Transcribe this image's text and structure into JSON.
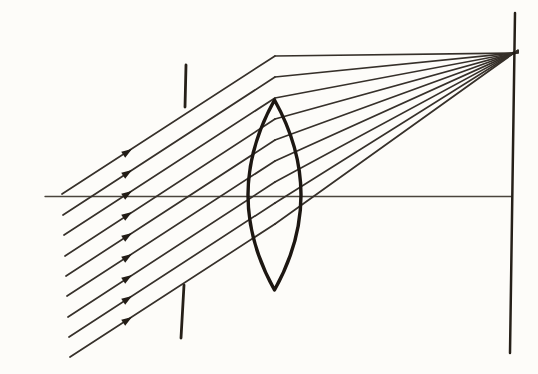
{
  "figure": {
    "canvas": {
      "width": 538,
      "height": 374,
      "background": "#fdfcf9"
    },
    "colors": {
      "ray_ink": "#36302a",
      "lens_ink": "#1d1712",
      "plane_ink": "#262019",
      "axis_ink": "#4a443c",
      "arrow_ink": "#221c16"
    },
    "optical_axis": {
      "x1": 45,
      "y1": 196.5,
      "x2": 512,
      "y2": 196.5,
      "stroke_width": 1.3
    },
    "aperture_stop": {
      "top_segment": {
        "x1": 186,
        "y1": 65,
        "x2": 185,
        "y2": 107,
        "stroke_width": 2.8
      },
      "bottom_segment": {
        "x1": 184,
        "y1": 285,
        "x2": 181,
        "y2": 338,
        "stroke_width": 2.8
      }
    },
    "focal_plane": {
      "x1": 515,
      "y1": 13,
      "x2": 510,
      "y2": 353,
      "stroke_width": 2.5
    },
    "lens": {
      "center_x": 274.5,
      "top_y": 100,
      "bottom_y": 290,
      "axis_y": 195,
      "half_width": 26.5,
      "stroke_width": 3.4
    },
    "focal_point": {
      "x": 514,
      "y": 53,
      "dot_radius": 1.8
    },
    "ray_bundle": {
      "count": 9,
      "incoming_slope": 0.65,
      "bend_x": 275,
      "overshoot_x": 518,
      "ray_stroke_width": 1.7,
      "arrow_x": 132,
      "arrow_length": 10.5,
      "arrow_half_width": 3.6,
      "rays": [
        {
          "start_x": 62,
          "start_y": 194,
          "bend_y": 56
        },
        {
          "start_x": 63,
          "start_y": 215,
          "bend_y": 77
        },
        {
          "start_x": 64,
          "start_y": 235,
          "bend_y": 98
        },
        {
          "start_x": 65,
          "start_y": 256,
          "bend_y": 119
        },
        {
          "start_x": 66,
          "start_y": 276,
          "bend_y": 140
        },
        {
          "start_x": 67,
          "start_y": 296,
          "bend_y": 161
        },
        {
          "start_x": 68,
          "start_y": 317,
          "bend_y": 182
        },
        {
          "start_x": 69,
          "start_y": 337,
          "bend_y": 203
        },
        {
          "start_x": 70,
          "start_y": 357,
          "bend_y": 224
        }
      ]
    }
  }
}
